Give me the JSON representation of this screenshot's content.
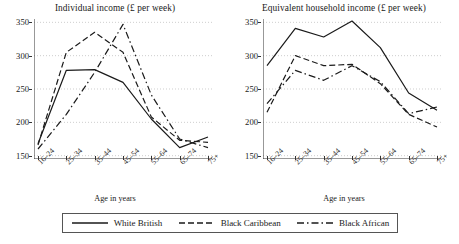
{
  "figure": {
    "legend": {
      "entries": [
        {
          "label": "White British",
          "style": "solid",
          "color": "#1a1a1a"
        },
        {
          "label": "Black Caribbean",
          "style": "dashed",
          "color": "#1a1a1a"
        },
        {
          "label": "Black African",
          "style": "dash-dot",
          "color": "#1a1a1a"
        }
      ]
    }
  },
  "chart_data": [
    {
      "type": "line",
      "title": "Individual income (£ per week)",
      "xlabel": "Age in years",
      "ylabel": "",
      "categories": [
        "16–24",
        "25–34",
        "35–44",
        "45–54",
        "55–64",
        "65–74",
        "75+"
      ],
      "yticks": [
        150,
        200,
        250,
        300,
        350
      ],
      "ylim": [
        145,
        355
      ],
      "grid": true,
      "legend_position": "bottom",
      "series": [
        {
          "name": "White British",
          "style": "solid",
          "values": [
            168,
            278,
            279,
            260,
            205,
            162,
            178
          ]
        },
        {
          "name": "Black Caribbean",
          "style": "dashed",
          "values": [
            166,
            305,
            335,
            305,
            208,
            173,
            170
          ]
        },
        {
          "name": "Black African",
          "style": "dash-dot",
          "values": [
            160,
            212,
            275,
            347,
            241,
            175,
            162
          ]
        }
      ]
    },
    {
      "type": "line",
      "title": "Equivalent household income (£ per week)",
      "xlabel": "Age in years",
      "ylabel": "",
      "categories": [
        "16–24",
        "25–34",
        "35–44",
        "45–54",
        "55–64",
        "65–74",
        "75+"
      ],
      "yticks": [
        150,
        200,
        250,
        300,
        350
      ],
      "ylim": [
        145,
        355
      ],
      "grid": true,
      "legend_position": "bottom",
      "series": [
        {
          "name": "White British",
          "style": "solid",
          "values": [
            285,
            341,
            328,
            352,
            312,
            244,
            218
          ]
        },
        {
          "name": "Black Caribbean",
          "style": "dashed",
          "values": [
            215,
            300,
            285,
            287,
            258,
            212,
            193
          ]
        },
        {
          "name": "Black African",
          "style": "dash-dot",
          "values": [
            228,
            278,
            263,
            285,
            261,
            213,
            223
          ]
        }
      ]
    }
  ]
}
